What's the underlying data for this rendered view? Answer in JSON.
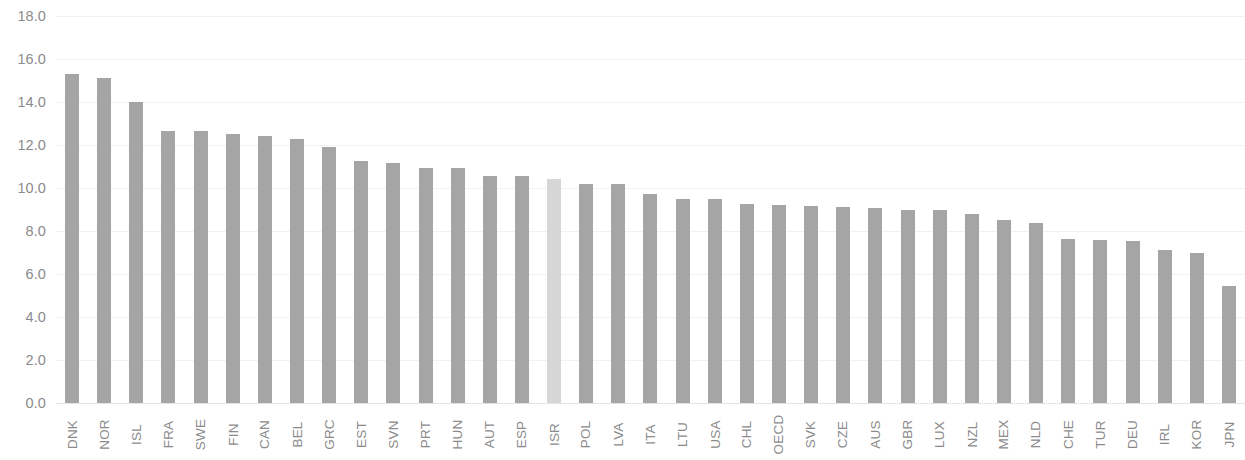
{
  "chart_data": {
    "type": "bar",
    "title": "",
    "subtitle": "",
    "xlabel": "",
    "ylabel": "",
    "ylim": [
      0.0,
      18.0
    ],
    "y_tick_step": 2.0,
    "y_ticks": [
      "0.0",
      "2.0",
      "4.0",
      "6.0",
      "8.0",
      "10.0",
      "12.0",
      "14.0",
      "16.0",
      "18.0"
    ],
    "y_tick_values": [
      0.0,
      2.0,
      4.0,
      6.0,
      8.0,
      10.0,
      12.0,
      14.0,
      16.0,
      18.0
    ],
    "grid": true,
    "grid_axis": "y",
    "legend": "none",
    "legend_position": "none",
    "bar_color": "#a5a5a5",
    "highlight_color": "#d6d6d6",
    "highlight_category": "ISR",
    "categories": [
      "DNK",
      "NOR",
      "ISL",
      "FRA",
      "SWE",
      "FIN",
      "CAN",
      "BEL",
      "GRC",
      "EST",
      "SVN",
      "PRT",
      "HUN",
      "AUT",
      "ESP",
      "ISR",
      "POL",
      "LVA",
      "ITA",
      "LTU",
      "USA",
      "CHL",
      "OECD",
      "SVK",
      "CZE",
      "AUS",
      "GBR",
      "LUX",
      "NZL",
      "MEX",
      "NLD",
      "CHE",
      "TUR",
      "DEU",
      "IRL",
      "KOR",
      "JPN"
    ],
    "values": [
      15.3,
      15.1,
      14.0,
      12.65,
      12.65,
      12.5,
      12.4,
      12.3,
      11.9,
      11.25,
      11.15,
      10.95,
      10.95,
      10.55,
      10.55,
      10.4,
      10.2,
      10.2,
      9.7,
      9.5,
      9.5,
      9.25,
      9.2,
      9.15,
      9.1,
      9.05,
      9.0,
      9.0,
      8.8,
      8.5,
      8.35,
      7.65,
      7.6,
      7.55,
      7.1,
      7.0,
      5.45
    ]
  }
}
